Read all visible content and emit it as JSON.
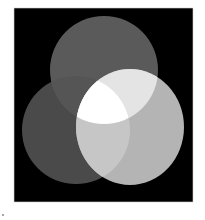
{
  "diagram": {
    "type": "venn-three-circles",
    "frame": {
      "x": 14,
      "y": 8,
      "width": 179,
      "height": 194,
      "color": "#000000"
    },
    "circles": [
      {
        "id": "top",
        "cx": 104,
        "cy": 70,
        "rx": 54,
        "ry": 54,
        "color": "#5a5a5a"
      },
      {
        "id": "left",
        "cx": 76,
        "cy": 130,
        "rx": 54,
        "ry": 54,
        "color": "#4a4a4a"
      },
      {
        "id": "right",
        "cx": 130,
        "cy": 127,
        "rx": 54,
        "ry": 58,
        "color": "#b4b4b4"
      }
    ],
    "overlaps": {
      "top_left": "#555555",
      "top_right": "#e4e4e4",
      "left_right": "#c6c6c6",
      "all_three": "#ffffff"
    }
  }
}
